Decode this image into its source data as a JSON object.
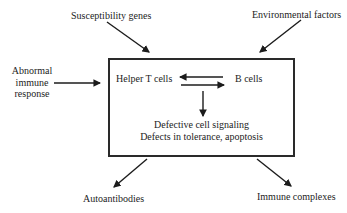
{
  "colors": {
    "ink": "#1c1c1c",
    "background": "#ffffff",
    "box_border": "#2a2a2a"
  },
  "diagram": {
    "external_factors": {
      "susceptibility_genes": "Susceptibility genes",
      "environmental_factors": "Environmental factors"
    },
    "left_input": {
      "lines": [
        "Abnormal",
        "immune",
        "response"
      ]
    },
    "box": {
      "helper_t_cells": "Helper T cells",
      "b_cells": "B cells",
      "caption_line1": "Defective cell signaling",
      "caption_line2": "Defects in tolerance, apoptosis"
    },
    "outputs": {
      "autoantibodies": "Autoantibodies",
      "immune_complexes": "Immune complexes"
    },
    "edges": [
      {
        "from": "Susceptibility genes",
        "to": "central box",
        "style": "arrow"
      },
      {
        "from": "Environmental factors",
        "to": "central box",
        "style": "arrow"
      },
      {
        "from": "Abnormal immune response",
        "to": "central box",
        "style": "arrow"
      },
      {
        "from": "B cells",
        "to": "Helper T cells",
        "style": "arrow"
      },
      {
        "from": "Helper T cells",
        "to": "B cells",
        "style": "arrow"
      },
      {
        "from": "Helper T cells / B cells",
        "to": "Defective cell signaling, Defects in tolerance, apoptosis",
        "style": "arrow"
      },
      {
        "from": "central box",
        "to": "Autoantibodies",
        "style": "arrow"
      },
      {
        "from": "central box",
        "to": "Immune complexes",
        "style": "arrow"
      }
    ]
  }
}
